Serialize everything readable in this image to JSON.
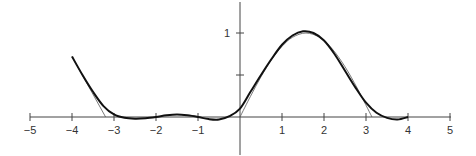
{
  "chart_data": {
    "type": "line",
    "title": "",
    "xlabel": "",
    "ylabel": "",
    "xlim": [
      -5,
      5
    ],
    "ylim": [
      -0.45,
      1.4
    ],
    "grid": false,
    "legend": null,
    "x_ticks": [
      -5,
      -4,
      -3,
      -2,
      -1,
      1,
      2,
      3,
      4,
      5
    ],
    "x_tick_labels": [
      "−5",
      "−4",
      "−3",
      "−2",
      "−1",
      "1",
      "2",
      "3",
      "4",
      "5"
    ],
    "y_ticks": [
      0.5,
      1
    ],
    "y_tick_labels": [
      "",
      "1"
    ],
    "series": [
      {
        "name": "target function (thin)",
        "style": "thin",
        "x": [
          -4,
          -3.2,
          -3.2,
          0,
          0.25,
          0.5,
          0.75,
          1.0,
          1.25,
          1.5708,
          1.9,
          2.2,
          2.5,
          2.8,
          3.1416
        ],
        "y": [
          0.72,
          0,
          0,
          0,
          0.247,
          0.479,
          0.682,
          0.841,
          0.949,
          1.0,
          0.946,
          0.808,
          0.598,
          0.335,
          0
        ]
      },
      {
        "name": "approximation (thick)",
        "style": "thick",
        "x": [
          -4,
          -3.75,
          -3.5,
          -3.25,
          -3,
          -2.75,
          -2.5,
          -2.25,
          -2,
          -1.75,
          -1.5,
          -1.25,
          -1,
          -0.75,
          -0.5,
          -0.25,
          0,
          0.25,
          0.5,
          0.75,
          1,
          1.25,
          1.5,
          1.75,
          2,
          2.25,
          2.5,
          2.75,
          3,
          3.25,
          3.5,
          3.75,
          4
        ],
        "y": [
          0.72,
          0.5,
          0.3,
          0.13,
          0.03,
          -0.01,
          -0.02,
          -0.015,
          0.0,
          0.02,
          0.03,
          0.02,
          0.0,
          -0.025,
          -0.03,
          0.01,
          0.1,
          0.3,
          0.5,
          0.69,
          0.86,
          0.97,
          1.02,
          1.0,
          0.91,
          0.75,
          0.55,
          0.35,
          0.17,
          0.05,
          -0.01,
          -0.03,
          0.0
        ]
      }
    ]
  },
  "axis": {
    "origin_px": [
      240,
      117
    ],
    "px_per_unit_x": 42,
    "px_per_unit_y": 84,
    "color": "#333333",
    "curve_color": "#111111"
  }
}
